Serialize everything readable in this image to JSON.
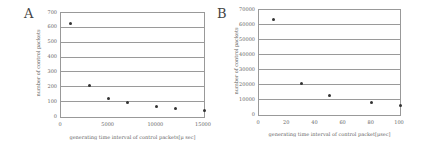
{
  "chart_data": [
    {
      "panel": "A",
      "type": "scatter",
      "title": "",
      "xlabel": "generating time interval of control packets[μ sec]",
      "ylabel": "number of control packets",
      "xlim": [
        0,
        15000
      ],
      "ylim": [
        0,
        700
      ],
      "x_ticks": [
        0,
        5000,
        10000,
        15000
      ],
      "y_ticks": [
        0,
        100,
        200,
        300,
        400,
        500,
        600,
        700
      ],
      "grid": "horizontal",
      "legend": null,
      "x": [
        1000,
        3000,
        5000,
        7000,
        10000,
        12000,
        15000
      ],
      "values": [
        630,
        215,
        125,
        100,
        70,
        60,
        45
      ]
    },
    {
      "panel": "B",
      "type": "scatter",
      "title": "",
      "xlabel": "generating time interval of control packet[μsec]",
      "ylabel": "number of control packets",
      "xlim": [
        0,
        100
      ],
      "ylim": [
        0,
        70000
      ],
      "x_ticks": [
        0,
        20,
        40,
        60,
        80,
        100
      ],
      "y_ticks": [
        0,
        10000,
        20000,
        30000,
        40000,
        50000,
        60000,
        70000
      ],
      "grid": "horizontal",
      "legend": null,
      "x": [
        10,
        30,
        50,
        80,
        100
      ],
      "values": [
        63500,
        21000,
        13000,
        8500,
        6500
      ]
    }
  ],
  "panels": {
    "a": {
      "letter": "A",
      "xlabel": "generating time interval of control packets[μ sec]",
      "ylabel": "number of control packets",
      "y_ticks": [
        "0",
        "100",
        "200",
        "300",
        "400",
        "500",
        "600",
        "700"
      ],
      "x_ticks": [
        "0",
        "5000",
        "10000",
        "15000"
      ]
    },
    "b": {
      "letter": "B",
      "xlabel": "generating time interval of control packet[μsec]",
      "ylabel": "number of control packets",
      "y_ticks": [
        "0",
        "10000",
        "20000",
        "30000",
        "40000",
        "50000",
        "60000",
        "70000"
      ],
      "x_ticks": [
        "0",
        "20",
        "40",
        "60",
        "80",
        "100"
      ]
    }
  }
}
